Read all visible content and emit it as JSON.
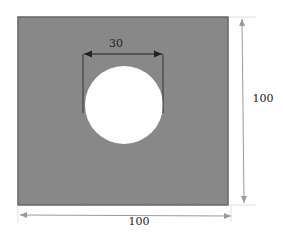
{
  "diagram": {
    "plate": {
      "width_label": "100",
      "height_label": "100",
      "fill": "#8a8a8a",
      "stroke": "#3a3a3a"
    },
    "hole": {
      "diameter_label": "30",
      "fill": "#ffffff"
    },
    "dimension_color": "#9a9a9a",
    "inner_dimension_color": "#222222"
  }
}
